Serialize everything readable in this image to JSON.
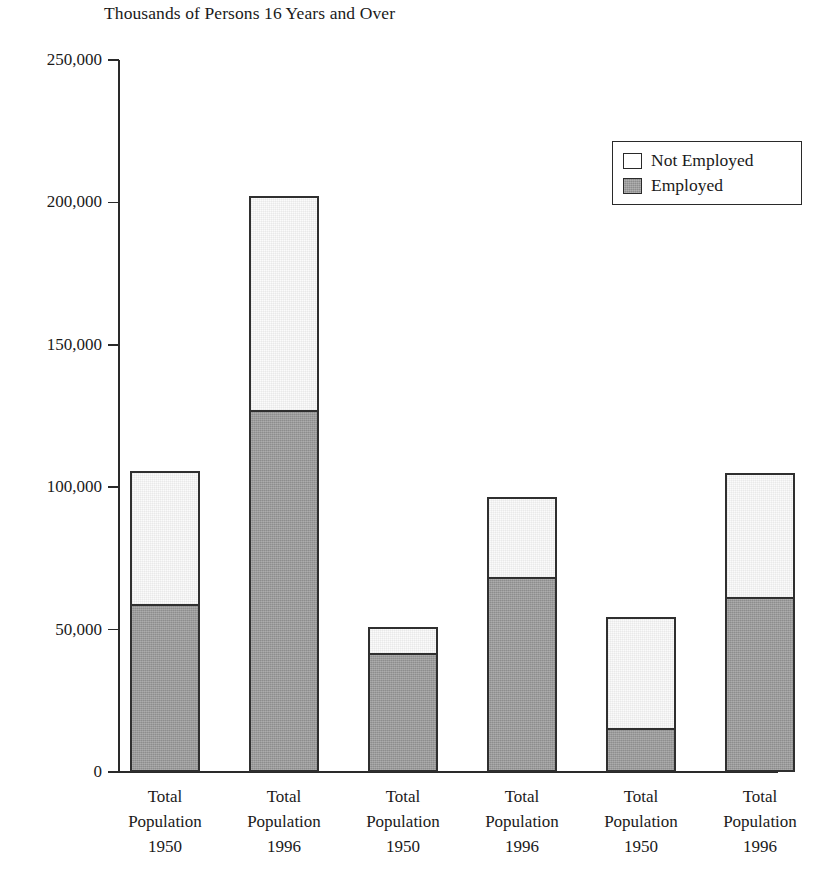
{
  "chart_data": {
    "type": "bar",
    "subtype": "stacked-bar",
    "title": "Thousands of Persons 16 Years and Over",
    "xlabel": "",
    "ylabel": "",
    "ylim": [
      0,
      250000
    ],
    "ytick_values": [
      0,
      50000,
      100000,
      150000,
      200000,
      250000
    ],
    "ytick_labels": [
      "0",
      "50,000",
      "100,000",
      "150,000",
      "200,000",
      "250,000"
    ],
    "grid": false,
    "legend_position": "top-right",
    "categories": [
      "Total Population 1950",
      "Total Population 1996",
      "Total Population 1950",
      "Total Population 1996",
      "Total Population 1950",
      "Total Population 1996"
    ],
    "category_lines": [
      [
        "Total",
        "Population",
        "1950"
      ],
      [
        "Total",
        "Population",
        "1996"
      ],
      [
        "Total",
        "Population",
        "1950"
      ],
      [
        "Total",
        "Population",
        "1996"
      ],
      [
        "Total",
        "Population",
        "1950"
      ],
      [
        "Total",
        "Population",
        "1996"
      ]
    ],
    "series": [
      {
        "name": "Employed",
        "color": "#9b9b9b",
        "values": [
          59000,
          127100,
          41800,
          68500,
          15400,
          61400
        ]
      },
      {
        "name": "Not Employed",
        "color": "#ffffff",
        "values": [
          46700,
          75100,
          9100,
          28100,
          39000,
          43600
        ]
      }
    ],
    "totals": [
      105700,
      202200,
      50900,
      96600,
      54400,
      105000
    ],
    "bars": [
      {
        "index": 0,
        "year": "1950",
        "total": 105700,
        "employed": 59000,
        "not_employed": 46700
      },
      {
        "index": 1,
        "year": "1996",
        "total": 202200,
        "employed": 127100,
        "not_employed": 75100
      },
      {
        "index": 2,
        "year": "1950",
        "total": 50900,
        "employed": 41800,
        "not_employed": 9100
      },
      {
        "index": 3,
        "year": "1996",
        "total": 96600,
        "employed": 68500,
        "not_employed": 28100
      },
      {
        "index": 4,
        "year": "1950",
        "total": 54400,
        "employed": 15400,
        "not_employed": 39000
      },
      {
        "index": 5,
        "year": "1996",
        "total": 105000,
        "employed": 61400,
        "not_employed": 43600
      }
    ]
  },
  "legend": {
    "items": [
      {
        "label": "Not Employed",
        "swatch": "white-square-icon"
      },
      {
        "label": "Employed",
        "swatch": "gray-square-icon"
      }
    ]
  },
  "axis": {
    "y_ticks": [
      {
        "label": "250,000",
        "value": 250000
      },
      {
        "label": "200,000",
        "value": 200000
      },
      {
        "label": "150,000",
        "value": 150000
      },
      {
        "label": "100,000",
        "value": 100000
      },
      {
        "label": "50,000",
        "value": 50000
      },
      {
        "label": "0",
        "value": 0
      }
    ]
  },
  "colors": {
    "employed_fill": "#9b9b9b",
    "not_employed_fill": "#ffffff",
    "outline": "#2f2f2f",
    "axis": "#2a2a2a",
    "text": "#1a1a1a",
    "background": "#ffffff"
  }
}
